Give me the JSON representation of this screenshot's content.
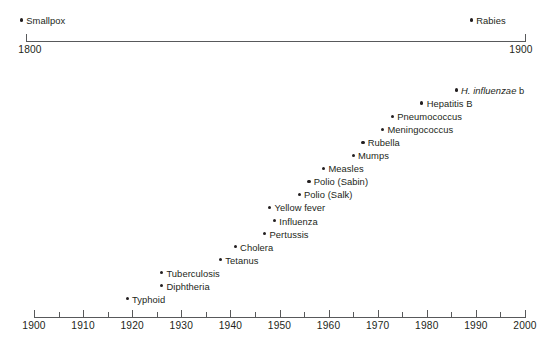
{
  "figure": {
    "background_color": "#ffffff",
    "marker_color": "#231f20",
    "axis_color": "#58595b"
  },
  "chart_data": {
    "type": "scatter",
    "title": "",
    "xlabel": "",
    "ylabel": "",
    "grid": false,
    "legend": "none",
    "panels": [
      {
        "name": "early-era",
        "xlim": [
          1800,
          1900
        ],
        "axis_tick_labels": [
          "1800",
          "1900"
        ],
        "axis_tick_values": [
          1800,
          1900
        ],
        "points": [
          {
            "label": "Smallpox",
            "year": 1798,
            "italic": false
          },
          {
            "label": "Rabies",
            "year": 1885,
            "italic": false
          }
        ]
      },
      {
        "name": "modern-era",
        "xlim": [
          1900,
          2000
        ],
        "axis_tick_labels": [
          "1900",
          "1910",
          "1920",
          "1930",
          "1940",
          "1950",
          "1960",
          "1970",
          "1980",
          "1990",
          "2000"
        ],
        "axis_tick_values": [
          1900,
          1910,
          1920,
          1930,
          1940,
          1950,
          1960,
          1970,
          1980,
          1990,
          2000
        ],
        "axis_minor_tick_values": [
          1905,
          1915,
          1925,
          1935,
          1945,
          1955,
          1965,
          1975,
          1985,
          1995
        ],
        "points": [
          {
            "label": "H. influenzae",
            "label_suffix": " b",
            "year": 1986,
            "italic": true
          },
          {
            "label": "Hepatitis B",
            "year": 1979,
            "italic": false
          },
          {
            "label": "Pneumococcus",
            "year": 1973,
            "italic": false
          },
          {
            "label": "Meningococcus",
            "year": 1971,
            "italic": false
          },
          {
            "label": "Rubella",
            "year": 1967,
            "italic": false
          },
          {
            "label": "Mumps",
            "year": 1965,
            "italic": false
          },
          {
            "label": "Measles",
            "year": 1959,
            "italic": false
          },
          {
            "label": "Polio (Sabin)",
            "year": 1956,
            "italic": false
          },
          {
            "label": "Polio (Salk)",
            "year": 1954,
            "italic": false
          },
          {
            "label": "Yellow fever",
            "year": 1948,
            "italic": false
          },
          {
            "label": "Influenza",
            "year": 1949,
            "italic": false
          },
          {
            "label": "Pertussis",
            "year": 1947,
            "italic": false
          },
          {
            "label": "Cholera",
            "year": 1941,
            "italic": false
          },
          {
            "label": "Tetanus",
            "year": 1938,
            "italic": false
          },
          {
            "label": "Tuberculosis",
            "year": 1926,
            "italic": false
          },
          {
            "label": "Diphtheria",
            "year": 1926,
            "italic": false
          },
          {
            "label": "Typhoid",
            "year": 1919,
            "italic": false
          }
        ]
      }
    ]
  }
}
